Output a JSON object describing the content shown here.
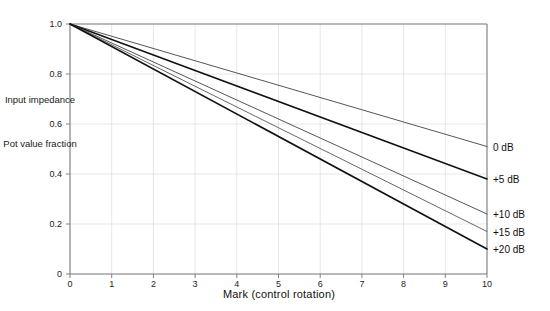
{
  "chart_data": {
    "type": "line",
    "title": "",
    "xlabel": "Mark  (control rotation)",
    "ylabel": "Pot value fraction",
    "ylabel_secondary": "Input impedance",
    "xlim": [
      0,
      10
    ],
    "ylim": [
      0,
      1.0
    ],
    "grid": true,
    "legend_position": "right-edge-inline",
    "x_ticks": [
      "0",
      "1",
      "2",
      "3",
      "4",
      "5",
      "6",
      "7",
      "8",
      "9",
      "10"
    ],
    "x_tick_values": [
      0,
      1,
      2,
      3,
      4,
      5,
      6,
      7,
      8,
      9,
      10
    ],
    "y_ticks": [
      "0",
      "0.2",
      "0.4",
      "0.6",
      "0.8",
      "1.0"
    ],
    "y_tick_values": [
      0,
      0.2,
      0.4,
      0.6,
      0.8,
      1.0
    ],
    "x": [
      0,
      10
    ],
    "series": [
      {
        "name": "0 dB",
        "label": "0 dB",
        "values": [
          1.0,
          0.51
        ],
        "color": "#555555",
        "width": 1.0
      },
      {
        "name": "+5 dB",
        "label": "+5 dB",
        "values": [
          1.0,
          0.38
        ],
        "color": "#111111",
        "width": 1.5
      },
      {
        "name": "+10 dB",
        "label": "+10 dB",
        "values": [
          1.0,
          0.24
        ],
        "color": "#555555",
        "width": 1.0
      },
      {
        "name": "+15 dB",
        "label": "+15 dB",
        "values": [
          1.0,
          0.17
        ],
        "color": "#666666",
        "width": 1.0
      },
      {
        "name": "+20 dB",
        "label": "+20 dB",
        "values": [
          1.0,
          0.1
        ],
        "color": "#111111",
        "width": 1.6
      }
    ],
    "colors": {
      "axis": "#808080",
      "grid": "#dcdcdc",
      "text": "#1a1a1a",
      "background": "#ffffff"
    }
  }
}
